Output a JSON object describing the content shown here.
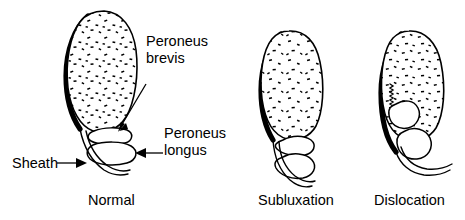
{
  "figure": {
    "kind": "anatomical-line-diagram",
    "background_color": "#ffffff",
    "ink_color": "#000000",
    "panel_count": 3
  },
  "labels": {
    "peroneus_brevis_line1": "Peroneus",
    "peroneus_brevis_line2": "brevis",
    "peroneus_longus_line1": "Peroneus",
    "peroneus_longus_line2": "longus",
    "sheath": "Sheath"
  },
  "panels": [
    {
      "id": "normal",
      "caption": "Normal"
    },
    {
      "id": "subluxation",
      "caption": "Subluxation"
    },
    {
      "id": "dislocation",
      "caption": "Dislocation"
    }
  ]
}
